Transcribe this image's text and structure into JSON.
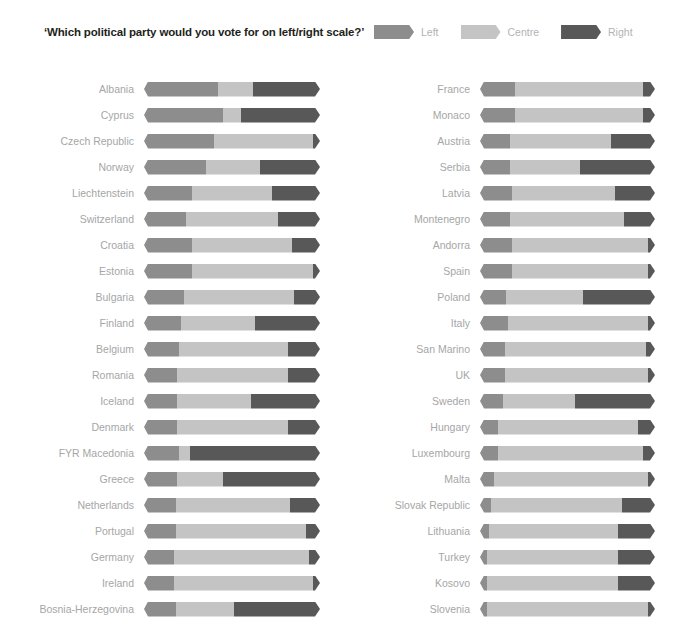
{
  "header": {
    "title": "‘Which political party would you vote for on left/right scale?’",
    "legend": [
      {
        "label": "Left",
        "color": "#8d8d8d",
        "key": "left"
      },
      {
        "label": "Centre",
        "color": "#c4c4c4",
        "key": "centre"
      },
      {
        "label": "Right",
        "color": "#585858",
        "key": "right"
      }
    ]
  },
  "colors": {
    "left": "#8d8d8d",
    "centre": "#c4c4c4",
    "right": "#585858",
    "label": "#a6a6a6",
    "title": "#231f20",
    "background": "#ffffff"
  },
  "chart_data": {
    "type": "bar",
    "title": "‘Which political party would you vote for on left/right scale?’",
    "subtype": "stacked-horizontal-100pct",
    "xlabel": "",
    "ylabel": "",
    "xlim": [
      0,
      100
    ],
    "grid": false,
    "legend_position": "top-right",
    "legend": [
      "Left",
      "Centre",
      "Right"
    ],
    "series": [
      {
        "name": "Left",
        "color": "#8d8d8d"
      },
      {
        "name": "Centre",
        "color": "#c4c4c4"
      },
      {
        "name": "Right",
        "color": "#585858"
      }
    ],
    "categories": [
      "Albania",
      "Cyprus",
      "Czech Republic",
      "Norway",
      "Liechtenstein",
      "Switzerland",
      "Croatia",
      "Estonia",
      "Bulgaria",
      "Finland",
      "Belgium",
      "Romania",
      "Iceland",
      "Denmark",
      "FYR Macedonia",
      "Greece",
      "Netherlands",
      "Portugal",
      "Germany",
      "Ireland",
      "Bosnia-Herzegovina",
      "France",
      "Monaco",
      "Austria",
      "Serbia",
      "Latvia",
      "Montenegro",
      "Andorra",
      "Spain",
      "Poland",
      "Italy",
      "San Marino",
      "UK",
      "Sweden",
      "Hungary",
      "Luxembourg",
      "Malta",
      "Slovak Republic",
      "Lithuania",
      "Turkey",
      "Kosovo",
      "Slovenia"
    ],
    "columns": {
      "left_column": [
        {
          "country": "Albania",
          "left": 42,
          "centre": 20,
          "right": 38
        },
        {
          "country": "Cyprus",
          "left": 45,
          "centre": 10,
          "right": 45
        },
        {
          "country": "Czech Republic",
          "left": 40,
          "centre": 56,
          "right": 4
        },
        {
          "country": "Norway",
          "left": 35,
          "centre": 31,
          "right": 34
        },
        {
          "country": "Liechtenstein",
          "left": 27,
          "centre": 46,
          "right": 27
        },
        {
          "country": "Switzerland",
          "left": 24,
          "centre": 52,
          "right": 24
        },
        {
          "country": "Croatia",
          "left": 27,
          "centre": 57,
          "right": 16
        },
        {
          "country": "Estonia",
          "left": 27,
          "centre": 69,
          "right": 4
        },
        {
          "country": "Bulgaria",
          "left": 23,
          "centre": 62,
          "right": 15
        },
        {
          "country": "Finland",
          "left": 21,
          "centre": 42,
          "right": 37
        },
        {
          "country": "Belgium",
          "left": 20,
          "centre": 62,
          "right": 18
        },
        {
          "country": "Romania",
          "left": 19,
          "centre": 63,
          "right": 18
        },
        {
          "country": "Iceland",
          "left": 19,
          "centre": 42,
          "right": 39
        },
        {
          "country": "Denmark",
          "left": 19,
          "centre": 63,
          "right": 18
        },
        {
          "country": "FYR Macedonia",
          "left": 20,
          "centre": 6,
          "right": 74
        },
        {
          "country": "Greece",
          "left": 19,
          "centre": 26,
          "right": 55
        },
        {
          "country": "Netherlands",
          "left": 18,
          "centre": 65,
          "right": 17
        },
        {
          "country": "Portugal",
          "left": 18,
          "centre": 74,
          "right": 8
        },
        {
          "country": "Germany",
          "left": 17,
          "centre": 77,
          "right": 6
        },
        {
          "country": "Ireland",
          "left": 17,
          "centre": 79,
          "right": 4
        },
        {
          "country": "Bosnia-Herzegovina",
          "left": 18,
          "centre": 33,
          "right": 49
        }
      ],
      "right_column": [
        {
          "country": "France",
          "left": 20,
          "centre": 73,
          "right": 7
        },
        {
          "country": "Monaco",
          "left": 20,
          "centre": 73,
          "right": 7
        },
        {
          "country": "Austria",
          "left": 17,
          "centre": 58,
          "right": 25
        },
        {
          "country": "Serbia",
          "left": 17,
          "centre": 40,
          "right": 43
        },
        {
          "country": "Latvia",
          "left": 18,
          "centre": 59,
          "right": 23
        },
        {
          "country": "Montenegro",
          "left": 17,
          "centre": 65,
          "right": 18
        },
        {
          "country": "Andorra",
          "left": 18,
          "centre": 78,
          "right": 4
        },
        {
          "country": "Spain",
          "left": 18,
          "centre": 78,
          "right": 4
        },
        {
          "country": "Poland",
          "left": 15,
          "centre": 44,
          "right": 41
        },
        {
          "country": "Italy",
          "left": 16,
          "centre": 80,
          "right": 4
        },
        {
          "country": "San Marino",
          "left": 14,
          "centre": 81,
          "right": 5
        },
        {
          "country": "UK",
          "left": 14,
          "centre": 82,
          "right": 4
        },
        {
          "country": "Sweden",
          "left": 13,
          "centre": 41,
          "right": 46
        },
        {
          "country": "Hungary",
          "left": 10,
          "centre": 80,
          "right": 10
        },
        {
          "country": "Luxembourg",
          "left": 10,
          "centre": 83,
          "right": 7
        },
        {
          "country": "Malta",
          "left": 8,
          "centre": 88,
          "right": 4
        },
        {
          "country": "Slovak Republic",
          "left": 6,
          "centre": 75,
          "right": 19
        },
        {
          "country": "Lithuania",
          "left": 5,
          "centre": 74,
          "right": 21
        },
        {
          "country": "Turkey",
          "left": 4,
          "centre": 75,
          "right": 21
        },
        {
          "country": "Kosovo",
          "left": 4,
          "centre": 75,
          "right": 21
        },
        {
          "country": "Slovenia",
          "left": 4,
          "centre": 92,
          "right": 4
        }
      ]
    }
  }
}
